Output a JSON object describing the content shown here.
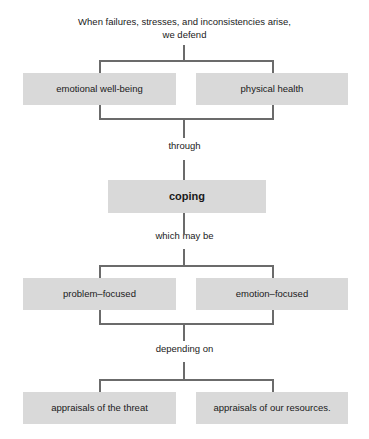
{
  "diagram": {
    "title_text": "When failures, stresses, and inconsistencies arise,\nwe defend",
    "levels": {
      "defend_pair": {
        "left_label": "emotional well-being",
        "right_label": "physical health"
      },
      "connector_1": "through",
      "coping": {
        "label": "coping"
      },
      "connector_2": "which may be",
      "coping_pair": {
        "left_label": "problem–focused",
        "right_label": "emotion–focused"
      },
      "connector_3": "depending on",
      "appraisal_pair": {
        "left_label": "appraisals of the threat",
        "right_label": "appraisals of our resources."
      }
    },
    "colors": {
      "box_fill": "#d9d9d9",
      "line": "#6b6b6b",
      "text": "#1a1a1a",
      "background": "#ffffff"
    }
  }
}
